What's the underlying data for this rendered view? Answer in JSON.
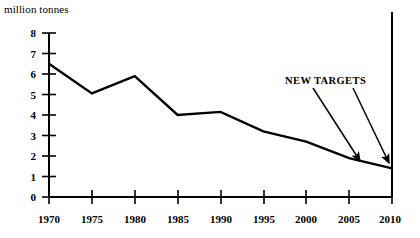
{
  "chart_data": {
    "type": "line",
    "title": "",
    "subtitle": "",
    "xlabel": "",
    "ylabel": "million tonnes",
    "unit_label": "million tonnes",
    "x": [
      1970,
      1975,
      1980,
      1985,
      1990,
      1995,
      2000,
      2005,
      2010
    ],
    "categories": [
      "1970",
      "1975",
      "1980",
      "1985",
      "1990",
      "1995",
      "2000",
      "2005",
      "2010"
    ],
    "values": [
      6.5,
      5.05,
      5.9,
      4.0,
      4.15,
      3.2,
      2.7,
      1.9,
      1.4
    ],
    "series": [
      {
        "name": "emissions",
        "values": [
          6.5,
          5.05,
          5.9,
          4.0,
          4.15,
          3.2,
          2.7,
          1.9,
          1.4
        ]
      }
    ],
    "xlim": [
      1970,
      2010
    ],
    "ylim": [
      0,
      8
    ],
    "ytick_labels": [
      "0",
      "1",
      "2",
      "3",
      "4",
      "5",
      "6",
      "7",
      "8"
    ],
    "ytick_values": [
      0,
      1,
      2,
      3,
      4,
      5,
      6,
      7,
      8
    ],
    "xtick_labels": [
      "1970",
      "1975",
      "1980",
      "1985",
      "1990",
      "1995",
      "2000",
      "2005",
      "2010"
    ],
    "grid": false,
    "legend": false,
    "legend_position": "none",
    "line_color": "#000000",
    "axis_color": "#000000",
    "background_color": "#ffffff",
    "annotations": [
      {
        "text": "NEW TARGETS",
        "points_to": [
          2005,
          2010
        ],
        "arrow_count": 2
      }
    ]
  },
  "annotation": {
    "new_targets_label": "NEW TARGETS"
  },
  "axis": {
    "unit_label": "million tonnes",
    "y_ticks": [
      "8",
      "7",
      "6",
      "5",
      "4",
      "3",
      "2",
      "1",
      "0"
    ],
    "x_ticks": [
      "1970",
      "1975",
      "1980",
      "1985",
      "1990",
      "1995",
      "2000",
      "2005",
      "2010"
    ]
  }
}
